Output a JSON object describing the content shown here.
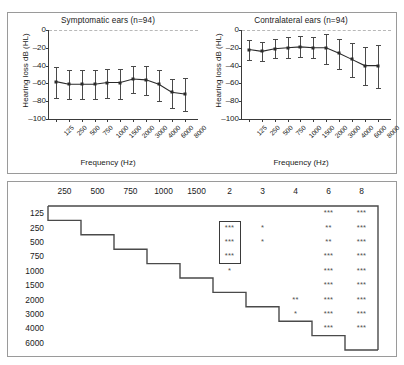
{
  "figure": {
    "title": "",
    "panels": [
      "audiogram-charts",
      "significance-matrix"
    ]
  },
  "chart_data": [
    {
      "type": "line",
      "id": "symptomatic",
      "title": "Symptomatic ears (n=94)",
      "xlabel": "Frequency (Hz)",
      "ylabel": "Hearing loss dB (HL)",
      "categories": [
        "125",
        "250",
        "500",
        "750",
        "1000",
        "1500",
        "2000",
        "3000",
        "4000",
        "6000",
        "8000"
      ],
      "values": [
        -58,
        -61,
        -61,
        -61,
        -59,
        -59,
        -55,
        -56,
        -61,
        -70,
        -72
      ],
      "err_low": [
        -76,
        -78,
        -78,
        -78,
        -76,
        -78,
        -71,
        -73,
        -80,
        -88,
        -91
      ],
      "err_high": [
        -42,
        -45,
        -45,
        -45,
        -44,
        -44,
        -41,
        -41,
        -45,
        -55,
        -54
      ],
      "ylim": [
        -100,
        0
      ],
      "yticks": [
        0,
        -20,
        -40,
        -60,
        -80,
        -100
      ],
      "ytick_labels": [
        "0",
        "-20",
        "-40",
        "-60",
        "-80",
        "-100"
      ],
      "zero_reference_line": true,
      "grid": false,
      "legend": "none"
    },
    {
      "type": "line",
      "id": "contralateral",
      "title": "Contralateral ears (n=94)",
      "xlabel": "Frequency (Hz)",
      "ylabel": "Hearing loss dB (HL)",
      "categories": [
        "125",
        "250",
        "500",
        "750",
        "1000",
        "1500",
        "2000",
        "3000",
        "4000",
        "6000",
        "8000"
      ],
      "values": [
        -22,
        -24,
        -21,
        -20,
        -19,
        -20,
        -20,
        -26,
        -33,
        -40,
        -40
      ],
      "err_low": [
        -34,
        -35,
        -32,
        -32,
        -30,
        -32,
        -38,
        -44,
        -53,
        -62,
        -65
      ],
      "err_high": [
        -11,
        -13,
        -10,
        -8,
        -7,
        -8,
        -5,
        -10,
        -15,
        -19,
        -17
      ],
      "ylim": [
        -100,
        0
      ],
      "yticks": [
        0,
        -20,
        -40,
        -60,
        -80,
        -100
      ],
      "ytick_labels": [
        "0",
        "-20",
        "-40",
        "-60",
        "-80",
        "-100"
      ],
      "zero_reference_line": true,
      "grid": false,
      "legend": "none"
    },
    {
      "type": "table",
      "id": "significance-matrix",
      "title": "",
      "columns": [
        "250",
        "500",
        "750",
        "1000",
        "1500",
        "2",
        "3",
        "4",
        "6",
        "8"
      ],
      "rows": [
        "125",
        "250",
        "500",
        "750",
        "1000",
        "1500",
        "2000",
        "3000",
        "4000",
        "6000"
      ],
      "cells": [
        [
          "",
          "",
          "",
          "",
          "",
          "",
          "",
          "",
          "***",
          "***"
        ],
        [
          "",
          "",
          "",
          "",
          "",
          "***",
          "*",
          "",
          "**",
          "***"
        ],
        [
          "",
          "",
          "",
          "",
          "",
          "***",
          "*",
          "",
          "**",
          "***"
        ],
        [
          "",
          "",
          "",
          "",
          "",
          "***",
          "",
          "",
          "***",
          "***"
        ],
        [
          "",
          "",
          "",
          "",
          "",
          "*",
          "",
          "",
          "***",
          "***"
        ],
        [
          "",
          "",
          "",
          "",
          "",
          "",
          "",
          "",
          "***",
          "***"
        ],
        [
          "",
          "",
          "",
          "",
          "",
          "",
          "",
          "**",
          "***",
          "***"
        ],
        [
          "",
          "",
          "",
          "",
          "",
          "",
          "",
          "*",
          "***",
          "***"
        ],
        [
          "",
          "",
          "",
          "",
          "",
          "",
          "",
          "",
          "***",
          "***"
        ],
        [
          "",
          "",
          "",
          "",
          "",
          "",
          "",
          "",
          "",
          ""
        ]
      ],
      "highlight_box": {
        "column": "2",
        "rows": [
          "250",
          "500",
          "750"
        ]
      }
    }
  ]
}
